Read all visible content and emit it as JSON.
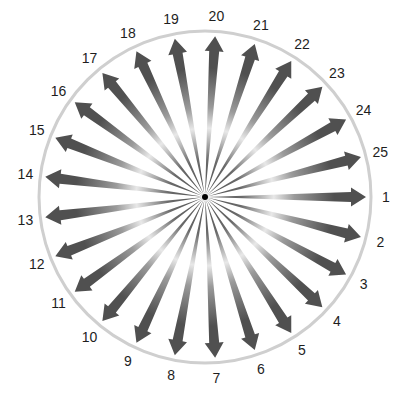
{
  "diagram": {
    "type": "radial-arrow-dial",
    "center": [
      205,
      197
    ],
    "ring": {
      "radius": 166,
      "color": "#cfcfcf",
      "width": 3
    },
    "hub": {
      "radius": 3,
      "color": "#000000"
    },
    "arrows": {
      "count": 25,
      "start_angle_deg": 0,
      "direction": "clockwise",
      "tip_radius": 161,
      "head_length": 15,
      "head_width": 19,
      "shaft_width": 10,
      "dark_color": "#505050",
      "light_color": "#e8e8e8"
    },
    "label_radius": 181,
    "labels": [
      "1",
      "2",
      "3",
      "4",
      "5",
      "6",
      "7",
      "8",
      "9",
      "10",
      "11",
      "12",
      "13",
      "14",
      "15",
      "16",
      "17",
      "18",
      "19",
      "20",
      "21",
      "22",
      "23",
      "24",
      "25"
    ]
  }
}
